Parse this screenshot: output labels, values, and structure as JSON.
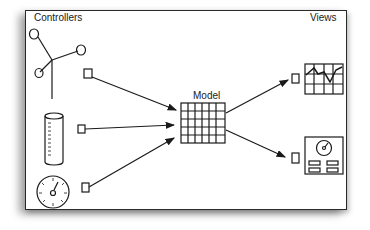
{
  "diagram": {
    "title_controllers": "Controllers",
    "title_views": "Views",
    "title_model": "Model",
    "controllers": [
      {
        "name": "joystick",
        "icon": "joystick-icon"
      },
      {
        "name": "cylinder",
        "icon": "cylinder-gauge-icon"
      },
      {
        "name": "dial",
        "icon": "dial-icon"
      }
    ],
    "views": [
      {
        "name": "chart-view",
        "icon": "line-chart-icon"
      },
      {
        "name": "dashboard-view",
        "icon": "dashboard-icon"
      }
    ],
    "colors": {
      "stroke": "#1a1a1a",
      "background": "#ffffff"
    }
  }
}
